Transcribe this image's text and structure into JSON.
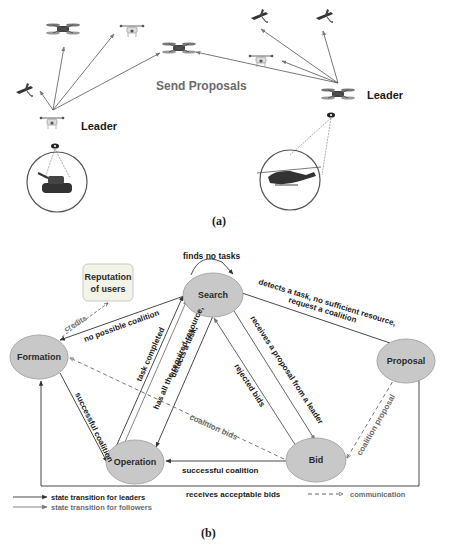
{
  "panel_a": {
    "caption": "(a)",
    "center_label": "Send Proposals",
    "leaders": [
      {
        "label": "Leader",
        "target": "tank"
      },
      {
        "label": "Leader",
        "target": "helicopter"
      }
    ],
    "icons": [
      "drone-icon",
      "fixed-wing-uav-icon",
      "tank-icon",
      "helicopter-icon",
      "eye-sensor-icon"
    ]
  },
  "panel_b": {
    "caption": "(b)",
    "nodes": {
      "search": "Search",
      "formation": "Formation",
      "proposal": "Proposal",
      "operation": "Operation",
      "bid": "Bid",
      "reputation": "Reputation of users",
      "reputation_l1": "Reputation",
      "reputation_l2": "of users"
    },
    "edges": {
      "self_loop": "finds no tasks",
      "search_to_proposal_l1": "detects a task, no sufficient resource,",
      "search_to_proposal_l2": "request a coalition",
      "search_to_formation": "no possible coalition",
      "credits": "credits",
      "operation_to_search": "task completed",
      "search_to_operation_l1": "detects a task,",
      "search_to_operation_l2": "has all the required resource,",
      "search_to_bid": "receives a proposal from a leader",
      "bid_to_search": "rejected bids",
      "formation_to_operation": "successful coalition",
      "bid_to_formation": "coalition bids",
      "bid_to_operation": "successful coalition",
      "proposal_to_bid": "coalition proposal",
      "proposal_to_formation": "receives acceptable bids"
    },
    "legend": {
      "leaders": "state transition for leaders",
      "followers": "state transition for followers",
      "communication": "communication"
    }
  },
  "colors": {
    "node_fill": "#c8c8c8",
    "leader_arrow": "#333333",
    "follower_arrow": "#777777",
    "communication": "#666666",
    "reputation_box": "#f3f3e8"
  }
}
